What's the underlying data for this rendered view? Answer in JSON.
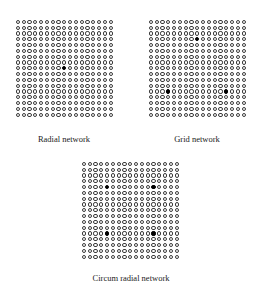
{
  "figure": {
    "panels": [
      {
        "id": "radial",
        "label": "Radial network",
        "rows": 17,
        "cols": 17,
        "grid_origin": [
          15,
          19
        ],
        "label_pos": [
          64,
          134
        ],
        "source_nodes": [
          [
            9,
            9
          ]
        ]
      },
      {
        "id": "grid",
        "label": "Grid network",
        "rows": 17,
        "cols": 17,
        "grid_origin": [
          148,
          19
        ],
        "label_pos": [
          197,
          134
        ],
        "source_nodes": [
          [
            4,
            9
          ],
          [
            13,
            4
          ],
          [
            13,
            14
          ]
        ]
      },
      {
        "id": "circum-radial",
        "label": "Circum radial network",
        "rows": 17,
        "cols": 17,
        "grid_origin": [
          81,
          161
        ],
        "label_pos": [
          131,
          273
        ],
        "source_nodes": [
          [
            5,
            5
          ],
          [
            5,
            13
          ],
          [
            13,
            5
          ],
          [
            13,
            13
          ]
        ]
      }
    ],
    "legend": {
      "open_node": "node (ring)",
      "filled_node": "source / feeder node (solid)"
    },
    "colors": {
      "node_ring": "#3a3a3a",
      "source_node": "#000000",
      "background": "#ffffff"
    }
  }
}
